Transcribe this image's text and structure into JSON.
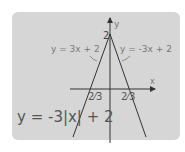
{
  "diagram": {
    "equation": "y = -3|x| + 2",
    "left_line_label": "y = 3x + 2",
    "right_line_label": "y = -3x + 2",
    "y_axis_label": "y",
    "x_axis_label": "x",
    "y_intercept_label": "2",
    "left_x_intercept_label": "-2/3",
    "left_x_intercept_display": "2⁄3",
    "right_x_intercept_label": "2/3",
    "right_x_intercept_display": "2⁄3",
    "colors": {
      "panel": "#d6d6d6",
      "lines": "#333333",
      "label_text": "#777777"
    }
  }
}
